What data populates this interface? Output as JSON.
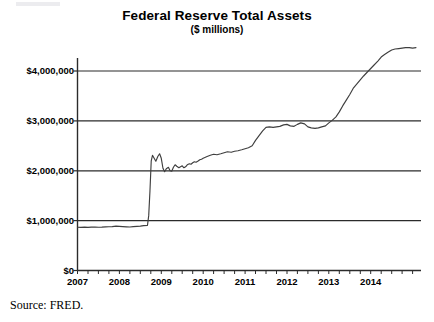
{
  "chart_data": {
    "type": "line",
    "title": "Federal Reserve Total Assets",
    "subtitle": "($ millions)",
    "xlabel": "",
    "ylabel": "",
    "xlim": [
      2007.0,
      2015.2
    ],
    "ylim": [
      0,
      4600000
    ],
    "grid": true,
    "gridlines_axis": "y",
    "legend": "none",
    "line_color": "#3f3f3f",
    "y_ticks": [
      0,
      1000000,
      2000000,
      3000000,
      4000000
    ],
    "y_tick_labels": [
      "$0",
      "$1,000,000",
      "$2,000,000",
      "$3,000,000",
      "$4,000,000"
    ],
    "x_ticks": [
      2007,
      2008,
      2009,
      2010,
      2011,
      2012,
      2013,
      2014
    ],
    "x_tick_labels": [
      "2007",
      "2008",
      "2009",
      "2010",
      "2011",
      "2012",
      "2013",
      "2014"
    ],
    "x_minor_tick_interval": 0.25,
    "series": [
      {
        "name": "Federal Reserve Total Assets",
        "x": [
          2007.0,
          2007.08,
          2007.17,
          2007.25,
          2007.33,
          2007.42,
          2007.5,
          2007.58,
          2007.67,
          2007.75,
          2007.83,
          2007.92,
          2008.0,
          2008.08,
          2008.17,
          2008.25,
          2008.33,
          2008.42,
          2008.5,
          2008.58,
          2008.67,
          2008.7,
          2008.73,
          2008.76,
          2008.79,
          2008.83,
          2008.87,
          2008.92,
          2008.96,
          2009.0,
          2009.04,
          2009.08,
          2009.12,
          2009.17,
          2009.21,
          2009.25,
          2009.29,
          2009.33,
          2009.37,
          2009.42,
          2009.46,
          2009.5,
          2009.54,
          2009.58,
          2009.62,
          2009.67,
          2009.71,
          2009.75,
          2009.79,
          2009.83,
          2009.87,
          2009.92,
          2009.96,
          2010.0,
          2010.08,
          2010.17,
          2010.25,
          2010.33,
          2010.42,
          2010.5,
          2010.58,
          2010.67,
          2010.75,
          2010.83,
          2010.92,
          2011.0,
          2011.08,
          2011.17,
          2011.25,
          2011.33,
          2011.42,
          2011.5,
          2011.58,
          2011.67,
          2011.75,
          2011.83,
          2011.92,
          2012.0,
          2012.08,
          2012.17,
          2012.25,
          2012.33,
          2012.42,
          2012.5,
          2012.58,
          2012.67,
          2012.75,
          2012.83,
          2012.92,
          2013.0,
          2013.08,
          2013.17,
          2013.25,
          2013.33,
          2013.42,
          2013.5,
          2013.58,
          2013.67,
          2013.75,
          2013.83,
          2013.92,
          2014.0,
          2014.08,
          2014.17,
          2014.25,
          2014.33,
          2014.42,
          2014.5,
          2014.58,
          2014.67,
          2014.75,
          2014.83,
          2014.92,
          2015.0,
          2015.08
        ],
        "values": [
          868000,
          866000,
          870000,
          865000,
          869000,
          872000,
          868000,
          870000,
          874000,
          877000,
          880000,
          890000,
          885000,
          880000,
          876000,
          872000,
          880000,
          885000,
          890000,
          900000,
          905000,
          1100000,
          1600000,
          2200000,
          2310000,
          2250000,
          2190000,
          2290000,
          2340000,
          2250000,
          2050000,
          1980000,
          2040000,
          2070000,
          2000000,
          1990000,
          2070000,
          2120000,
          2090000,
          2060000,
          2080000,
          2100000,
          2060000,
          2080000,
          2120000,
          2140000,
          2130000,
          2160000,
          2180000,
          2170000,
          2190000,
          2220000,
          2230000,
          2250000,
          2280000,
          2310000,
          2330000,
          2320000,
          2340000,
          2360000,
          2380000,
          2370000,
          2390000,
          2400000,
          2420000,
          2440000,
          2460000,
          2500000,
          2610000,
          2700000,
          2800000,
          2870000,
          2880000,
          2870000,
          2880000,
          2890000,
          2920000,
          2930000,
          2900000,
          2890000,
          2930000,
          2960000,
          2940000,
          2880000,
          2860000,
          2850000,
          2860000,
          2880000,
          2900000,
          2960000,
          3010000,
          3080000,
          3180000,
          3300000,
          3420000,
          3530000,
          3650000,
          3740000,
          3820000,
          3900000,
          3980000,
          4050000,
          4120000,
          4200000,
          4280000,
          4330000,
          4380000,
          4420000,
          4440000,
          4450000,
          4460000,
          4470000,
          4470000,
          4460000,
          4470000
        ]
      }
    ],
    "annotations": [],
    "source_note": "Source: FRED."
  },
  "figure": {
    "title": "Federal Reserve Total Assets",
    "subtitle": "($ millions)",
    "source_note": "Source: FRED."
  }
}
